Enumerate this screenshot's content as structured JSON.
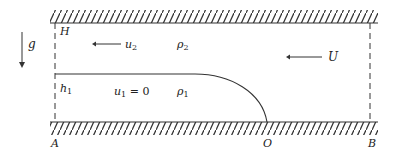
{
  "diagram": {
    "type": "two-layer channel flow",
    "labels": {
      "gravity": "g",
      "height_top": "H",
      "interface_height": "h",
      "interface_height_sub": "1",
      "upper_velocity": "u",
      "upper_velocity_sub": "2",
      "upper_density": "ρ",
      "upper_density_sub": "2",
      "lower_velocity": "u",
      "lower_velocity_sub": "1",
      "lower_velocity_value": " = 0",
      "lower_density": "ρ",
      "lower_density_sub": "1",
      "far_field_velocity": "U",
      "point_a": "A",
      "point_o": "O",
      "point_b": "B"
    },
    "colors": {
      "line": "#333333",
      "text": "#222222",
      "background": "#ffffff"
    }
  }
}
